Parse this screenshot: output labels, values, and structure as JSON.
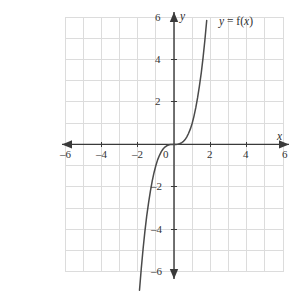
{
  "figure": {
    "kind": "cartesian-graph",
    "background_color": "#ffffff",
    "grid_color": "#dcdcdc",
    "axis_color": "#3a3a3a",
    "curve_color": "#4a4a4a",
    "label_color": "#333333"
  },
  "curve_label": {
    "full_text": "y = f(x)",
    "y_part": "y",
    "equals_part": " = f(",
    "x_part": "x",
    "close_part": ")"
  },
  "axes": {
    "x_axis_name": "x",
    "y_axis_name": "y",
    "x_ticks": [
      "-6",
      "-4",
      "-2",
      "0",
      "2",
      "4",
      "6"
    ],
    "y_ticks": [
      "6",
      "4",
      "2",
      "-2",
      "-4",
      "-6"
    ]
  },
  "x_labels": {
    "n6": "–6",
    "n4": "–4",
    "n2": "–2",
    "zero": "0",
    "p2": "2",
    "p4": "4",
    "p6": "6"
  },
  "y_labels": {
    "p6": "6",
    "p4": "4",
    "p2": "2",
    "n2": "–2",
    "n4": "–4",
    "n6": "–6"
  },
  "chart_data": {
    "type": "line",
    "title": "",
    "subtitle": "",
    "xlabel": "x",
    "ylabel": "y",
    "xlim": [
      -6,
      6
    ],
    "ylim": [
      -6,
      6
    ],
    "xticks": [
      -6,
      -4,
      -2,
      0,
      2,
      4,
      6
    ],
    "yticks": [
      -6,
      -4,
      -2,
      2,
      4,
      6
    ],
    "grid": true,
    "grid_step": 1,
    "legend": "y = f(x)",
    "legend_position": "top-right",
    "series": [
      {
        "name": "y = f(x)",
        "formula": "y = x^3",
        "x": [
          -1.9,
          -1.8,
          -1.7,
          -1.6,
          -1.5,
          -1.4,
          -1.3,
          -1.2,
          -1.1,
          -1.0,
          -0.9,
          -0.8,
          -0.7,
          -0.6,
          -0.5,
          -0.4,
          -0.3,
          -0.2,
          -0.1,
          0.0,
          0.1,
          0.2,
          0.3,
          0.4,
          0.5,
          0.6,
          0.7,
          0.8,
          0.9,
          1.0,
          1.1,
          1.2,
          1.3,
          1.4,
          1.5,
          1.6,
          1.7,
          1.8,
          1.9,
          2.0,
          2.1,
          2.2,
          2.3,
          2.4,
          2.5,
          2.6,
          2.7,
          2.8,
          2.9,
          3.0
        ],
        "y": [
          -6.859,
          -5.832,
          -4.913,
          -4.096,
          -3.375,
          -2.744,
          -2.197,
          -1.728,
          -1.331,
          -1.0,
          -0.729,
          -0.512,
          -0.343,
          -0.216,
          -0.125,
          -0.064,
          -0.027,
          -0.008,
          -0.001,
          0.0,
          0.001,
          0.008,
          0.027,
          0.064,
          0.125,
          0.216,
          0.343,
          0.512,
          0.729,
          1.0,
          1.331,
          1.728,
          2.197,
          2.744,
          3.375,
          4.096,
          4.913,
          5.832,
          6.859,
          8.0,
          9.261,
          10.648,
          12.167,
          13.824,
          15.625,
          17.576,
          19.683,
          21.952,
          24.389,
          27.0
        ]
      }
    ],
    "annotations": [
      {
        "text": "y = f(x)",
        "x": 3.1,
        "y": 5.7
      }
    ]
  }
}
